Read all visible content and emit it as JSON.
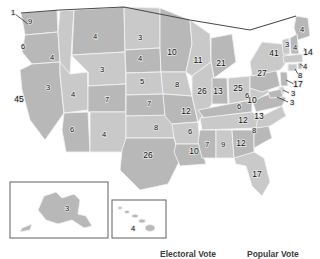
{
  "figure": {
    "kind": "us-electoral-college-map",
    "colors": {
      "land": "#b8b8b8",
      "land_light": "#c9c9c9",
      "land_dark": "#ababab",
      "border": "#f2f2f2",
      "outline": "#4a4a4a",
      "background": "#ffffff",
      "label_text": "#111111",
      "caption_text": "#3c3c3c"
    }
  },
  "captions": {
    "electoral_vote": "Electoral Vote",
    "popular_vote": "Popular Vote"
  },
  "insets": {
    "alaska": {
      "label": "3"
    },
    "hawaii": {
      "label": "4"
    }
  },
  "chart_data": {
    "type": "map",
    "title": "Electoral Vote",
    "value_label": "Electoral votes",
    "total_labeled": 538,
    "states": [
      {
        "code": "WA",
        "label": "9",
        "x": 30,
        "y": 22
      },
      {
        "code": "OR",
        "label": "6",
        "x": 23,
        "y": 47
      },
      {
        "code": "CA",
        "label": "45",
        "x": 19,
        "y": 100
      },
      {
        "code": "NV",
        "label": "3",
        "x": 48,
        "y": 88
      },
      {
        "code": "ID",
        "label": "4",
        "x": 52,
        "y": 58
      },
      {
        "code": "MT",
        "label": "4",
        "x": 95,
        "y": 37
      },
      {
        "code": "WY",
        "label": "3",
        "x": 102,
        "y": 70
      },
      {
        "code": "UT",
        "label": "4",
        "x": 73,
        "y": 95
      },
      {
        "code": "AZ",
        "label": "6",
        "x": 72,
        "y": 130
      },
      {
        "code": "NM",
        "label": "4",
        "x": 104,
        "y": 135
      },
      {
        "code": "CO",
        "label": "7",
        "x": 107,
        "y": 100
      },
      {
        "code": "ND",
        "label": "3",
        "x": 140,
        "y": 38
      },
      {
        "code": "SD",
        "label": "4",
        "x": 140,
        "y": 59
      },
      {
        "code": "NE",
        "label": "5",
        "x": 142,
        "y": 82
      },
      {
        "code": "KS",
        "label": "7",
        "x": 149,
        "y": 104
      },
      {
        "code": "OK",
        "label": "8",
        "x": 156,
        "y": 128
      },
      {
        "code": "TX",
        "label": "26",
        "x": 148,
        "y": 156
      },
      {
        "code": "MN",
        "label": "10",
        "x": 172,
        "y": 53
      },
      {
        "code": "IA",
        "label": "8",
        "x": 177,
        "y": 85
      },
      {
        "code": "MO",
        "label": "12",
        "x": 186,
        "y": 112
      },
      {
        "code": "AR",
        "label": "6",
        "x": 190,
        "y": 132
      },
      {
        "code": "LA",
        "label": "10",
        "x": 194,
        "y": 152
      },
      {
        "code": "WI",
        "label": "11",
        "x": 198,
        "y": 61
      },
      {
        "code": "MI",
        "label": "21",
        "x": 221,
        "y": 64
      },
      {
        "code": "IL",
        "label": "26",
        "x": 202,
        "y": 92
      },
      {
        "code": "IN",
        "label": "13",
        "x": 218,
        "y": 92
      },
      {
        "code": "OH",
        "label": "25",
        "x": 238,
        "y": 89
      },
      {
        "code": "KY",
        "label": "6",
        "x": 239,
        "y": 107
      },
      {
        "code": "TN",
        "label": "12",
        "x": 243,
        "y": 121
      },
      {
        "code": "MS",
        "label": "7",
        "x": 207,
        "y": 145
      },
      {
        "code": "AL",
        "label": "9",
        "x": 223,
        "y": 145
      },
      {
        "code": "GA",
        "label": "12",
        "x": 241,
        "y": 144
      },
      {
        "code": "FL",
        "label": "17",
        "x": 257,
        "y": 175
      },
      {
        "code": "SC",
        "label": "8",
        "x": 254,
        "y": 131
      },
      {
        "code": "NC",
        "label": "13",
        "x": 259,
        "y": 117
      },
      {
        "code": "VA",
        "label": "10",
        "x": 252,
        "y": 101
      },
      {
        "code": "WV",
        "label": "6",
        "x": 247,
        "y": 96
      },
      {
        "code": "PA",
        "label": "27",
        "x": 262,
        "y": 74
      },
      {
        "code": "NY",
        "label": "41",
        "x": 274,
        "y": 54
      },
      {
        "code": "ME",
        "label": "4",
        "x": 302,
        "y": 30
      },
      {
        "code": "VT",
        "label": "3",
        "x": 287,
        "y": 45
      },
      {
        "code": "NH",
        "label": "4",
        "x": 295,
        "y": 48
      },
      {
        "code": "MA",
        "label": "14",
        "x": 308,
        "y": 53
      },
      {
        "code": "RI",
        "label": "4",
        "x": 305,
        "y": 67
      },
      {
        "code": "CT",
        "label": "8",
        "x": 300,
        "y": 76
      },
      {
        "code": "NJ",
        "label": "17",
        "x": 298,
        "y": 85
      },
      {
        "code": "DE",
        "label": "3",
        "x": 293,
        "y": 94
      },
      {
        "code": "MD",
        "label": "3",
        "x": 292,
        "y": 103
      },
      {
        "code": "AK",
        "label": "3",
        "x": 67,
        "y": 209
      },
      {
        "code": "HI",
        "label": "4",
        "x": 133,
        "y": 229
      },
      {
        "code": "NE-D",
        "label": "1",
        "x": 13,
        "y": 13
      }
    ]
  }
}
